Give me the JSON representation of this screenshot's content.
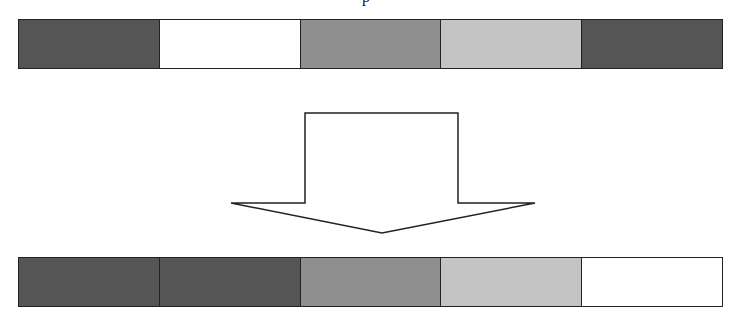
{
  "diagram": {
    "top_fragment": "p",
    "before_bar": {
      "cells": [
        {
          "shade": "dark",
          "color": "#555555"
        },
        {
          "shade": "white",
          "color": "#ffffff"
        },
        {
          "shade": "medium",
          "color": "#8f8f8f"
        },
        {
          "shade": "light",
          "color": "#c4c4c4"
        },
        {
          "shade": "dark",
          "color": "#555555"
        }
      ]
    },
    "arrow": {
      "direction": "down",
      "fill": "#ffffff",
      "stroke": "#222222"
    },
    "after_bar": {
      "cells": [
        {
          "shade": "dark",
          "color": "#555555"
        },
        {
          "shade": "dark",
          "color": "#555555"
        },
        {
          "shade": "medium",
          "color": "#8f8f8f"
        },
        {
          "shade": "light",
          "color": "#c4c4c4"
        },
        {
          "shade": "white",
          "color": "#ffffff"
        }
      ]
    }
  }
}
